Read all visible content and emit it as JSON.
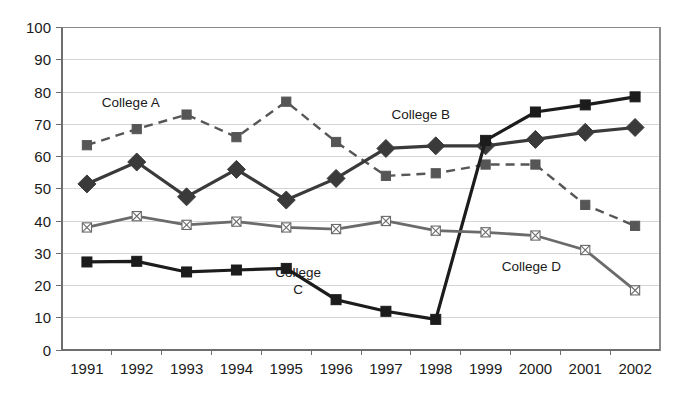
{
  "chart_data": {
    "type": "line",
    "title": "",
    "subtitle": "",
    "xlabel": "",
    "ylabel": "",
    "categories": [
      "1991",
      "1992",
      "1993",
      "1994",
      "1995",
      "1996",
      "1997",
      "1998",
      "1999",
      "2000",
      "2001",
      "2002"
    ],
    "ylim": [
      0,
      100
    ],
    "yticks": [
      "0",
      "10",
      "20",
      "30",
      "40",
      "50",
      "60",
      "70",
      "80",
      "90",
      "100"
    ],
    "grid": "horizontal",
    "legend": "inline-annotations",
    "series": [
      {
        "name": "College A",
        "marker": "square",
        "linestyle": "dashed",
        "color": "#565656",
        "values": [
          63.5,
          68.5,
          73,
          66,
          77,
          64.5,
          54,
          54.8,
          57.5,
          57.5,
          45,
          38.5
        ]
      },
      {
        "name": "College B",
        "marker": "diamond",
        "linestyle": "solid",
        "color": "#3a3a3a",
        "values": [
          51.5,
          58.3,
          47.5,
          56,
          46.5,
          53.2,
          62.5,
          63.3,
          63.3,
          65.3,
          67.5,
          69
        ]
      },
      {
        "name": "College C",
        "marker": "square",
        "linestyle": "solid",
        "color": "#1c1c1c",
        "values": [
          27.3,
          27.5,
          24.2,
          24.8,
          25.3,
          15.6,
          12,
          9.5,
          65,
          73.8,
          76,
          78.5
        ]
      },
      {
        "name": "College D",
        "marker": "x-square",
        "linestyle": "solid",
        "color": "#6b6b6b",
        "values": [
          38,
          41.5,
          38.8,
          39.8,
          38,
          37.5,
          40,
          37,
          36.5,
          35.5,
          31,
          18.5
        ]
      }
    ],
    "annotations": [
      {
        "text": "College A",
        "lines": [
          "College A"
        ],
        "x_frac": 0.115,
        "y_value": 75.5
      },
      {
        "text": "College B",
        "lines": [
          "College B"
        ],
        "x_frac": 0.6,
        "y_value": 71.5
      },
      {
        "text": "College C",
        "lines": [
          "College",
          "C"
        ],
        "x_frac": 0.395,
        "y_value": 22.5
      },
      {
        "text": "College D",
        "lines": [
          "College D"
        ],
        "x_frac": 0.785,
        "y_value": 24.5
      }
    ]
  }
}
